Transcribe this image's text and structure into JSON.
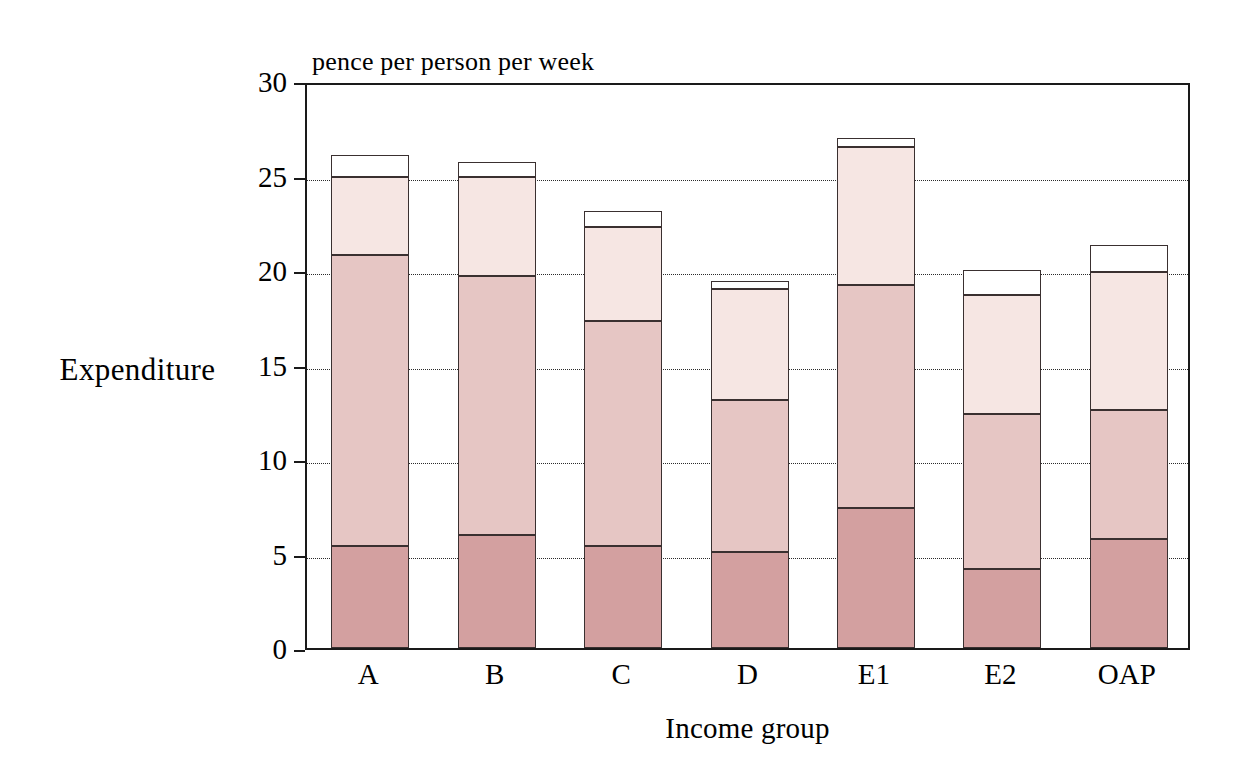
{
  "chart_data": {
    "type": "bar",
    "subtype": "stacked-bar",
    "title": "",
    "units_title": "pence per person per week",
    "xlabel": "Income group",
    "ylabel": "Expenditure",
    "categories": [
      "A",
      "B",
      "C",
      "D",
      "E1",
      "E2",
      "OAP"
    ],
    "ylim": [
      0,
      30
    ],
    "yticks": [
      0,
      5,
      10,
      15,
      20,
      25,
      30
    ],
    "ytick_labels": [
      "0",
      "5",
      "10",
      "15",
      "20",
      "25",
      "30"
    ],
    "grid": "horizontal-dotted",
    "legend": "none",
    "series": [
      {
        "name": "segment-1",
        "color": "#d3a0a0",
        "values": [
          5.4,
          6.0,
          5.4,
          5.1,
          7.4,
          4.2,
          5.75
        ]
      },
      {
        "name": "segment-2",
        "color": "#e6c6c4",
        "values": [
          15.4,
          13.7,
          11.9,
          8.0,
          11.8,
          8.2,
          6.85
        ]
      },
      {
        "name": "segment-3",
        "color": "#f6e6e3",
        "values": [
          4.1,
          5.2,
          5.0,
          5.9,
          7.3,
          6.3,
          7.3
        ]
      },
      {
        "name": "segment-4",
        "color": "#ffffff",
        "values": [
          1.2,
          0.8,
          0.8,
          0.4,
          0.5,
          1.3,
          1.4
        ]
      }
    ],
    "totals": [
      26.1,
      25.7,
      23.1,
      19.4,
      27.0,
      20.1,
      21.3
    ]
  },
  "axis": {
    "y_title": "Expenditure",
    "x_title": "Income group",
    "units": "pence per person per week"
  },
  "colors": {
    "segment_1": "#d3a0a0",
    "segment_2": "#e6c6c4",
    "segment_3": "#f6e6e3",
    "segment_4": "#ffffff",
    "outline": "#3a3030",
    "axis": "#1a1a1a",
    "grid": "#2b2b2b",
    "background": "#ffffff"
  }
}
